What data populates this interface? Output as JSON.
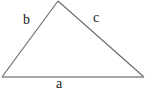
{
  "figure": {
    "type": "triangle-diagram",
    "labels": {
      "side_left": "b",
      "side_right": "c",
      "side_bottom": "a"
    },
    "colors": {
      "line": "#6e6e6e",
      "bottom_line": "#8a8a8a",
      "text": "#1a1a1a",
      "background": "#ffffff"
    }
  }
}
